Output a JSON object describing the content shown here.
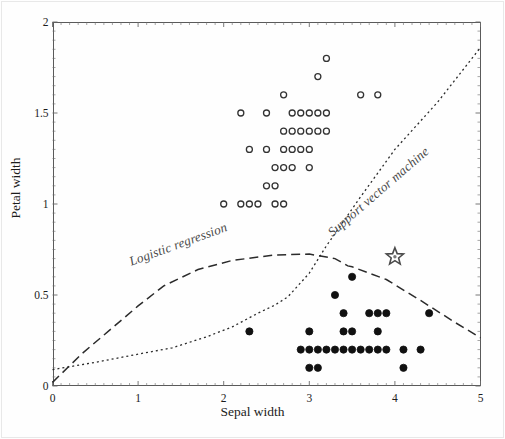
{
  "figure": {
    "background": "#ffffff",
    "frame_color": "#5a5a5a"
  },
  "chart_data": {
    "type": "scatter",
    "title": "",
    "xlabel": "Sepal width",
    "ylabel": "Petal width",
    "xlim": [
      0,
      5
    ],
    "ylim": [
      0,
      2
    ],
    "xticks": [
      0,
      1,
      2,
      3,
      4,
      5
    ],
    "xtick_labels": [
      "0",
      "1",
      "2",
      "3",
      "4",
      "5"
    ],
    "yticks": [
      0,
      0.5,
      1,
      1.5,
      2
    ],
    "ytick_labels": [
      "0",
      "0.5",
      "1",
      "1.5",
      "2"
    ],
    "grid": false,
    "legend": "none (inline rotated curve labels)",
    "series": [
      {
        "name": "class-open-circle",
        "marker": "open-circle",
        "color": "#333333",
        "points": [
          [
            3.2,
            1.8
          ],
          [
            3.1,
            1.7
          ],
          [
            2.7,
            1.6
          ],
          [
            3.6,
            1.6
          ],
          [
            3.8,
            1.6
          ],
          [
            2.2,
            1.5
          ],
          [
            2.5,
            1.5
          ],
          [
            2.8,
            1.5
          ],
          [
            2.9,
            1.5
          ],
          [
            3.0,
            1.5
          ],
          [
            3.1,
            1.5
          ],
          [
            3.2,
            1.5
          ],
          [
            2.7,
            1.4
          ],
          [
            2.8,
            1.4
          ],
          [
            2.9,
            1.4
          ],
          [
            3.0,
            1.4
          ],
          [
            3.1,
            1.4
          ],
          [
            3.2,
            1.4
          ],
          [
            2.3,
            1.3
          ],
          [
            2.5,
            1.3
          ],
          [
            2.7,
            1.3
          ],
          [
            2.8,
            1.3
          ],
          [
            2.9,
            1.3
          ],
          [
            3.0,
            1.3
          ],
          [
            2.6,
            1.2
          ],
          [
            2.7,
            1.2
          ],
          [
            2.8,
            1.2
          ],
          [
            3.0,
            1.2
          ],
          [
            2.5,
            1.1
          ],
          [
            2.6,
            1.1
          ],
          [
            2.0,
            1.0
          ],
          [
            2.2,
            1.0
          ],
          [
            2.3,
            1.0
          ],
          [
            2.4,
            1.0
          ],
          [
            2.6,
            1.0
          ],
          [
            2.7,
            1.0
          ]
        ]
      },
      {
        "name": "class-filled-circle",
        "marker": "filled-circle",
        "color": "#111111",
        "points": [
          [
            3.5,
            0.6
          ],
          [
            3.3,
            0.5
          ],
          [
            3.4,
            0.4
          ],
          [
            3.7,
            0.4
          ],
          [
            3.8,
            0.4
          ],
          [
            3.9,
            0.4
          ],
          [
            4.4,
            0.4
          ],
          [
            2.3,
            0.3
          ],
          [
            3.0,
            0.3
          ],
          [
            3.4,
            0.3
          ],
          [
            3.5,
            0.3
          ],
          [
            3.8,
            0.3
          ],
          [
            2.9,
            0.2
          ],
          [
            3.0,
            0.2
          ],
          [
            3.1,
            0.2
          ],
          [
            3.2,
            0.2
          ],
          [
            3.3,
            0.2
          ],
          [
            3.4,
            0.2
          ],
          [
            3.5,
            0.2
          ],
          [
            3.6,
            0.2
          ],
          [
            3.7,
            0.2
          ],
          [
            3.8,
            0.2
          ],
          [
            3.9,
            0.2
          ],
          [
            4.1,
            0.2
          ],
          [
            4.3,
            0.2
          ],
          [
            3.0,
            0.1
          ],
          [
            3.1,
            0.1
          ],
          [
            4.1,
            0.1
          ]
        ]
      },
      {
        "name": "query-point-star",
        "marker": "star",
        "color": "#555555",
        "points": [
          [
            4.0,
            0.71
          ]
        ]
      }
    ],
    "boundaries": [
      {
        "name": "logistic-regression",
        "label": "Logistic regression",
        "style": "dashed",
        "color": "#2b2b2b",
        "points": [
          [
            0.0,
            0.02
          ],
          [
            0.35,
            0.18
          ],
          [
            0.7,
            0.32
          ],
          [
            1.0,
            0.44
          ],
          [
            1.3,
            0.55
          ],
          [
            1.7,
            0.64
          ],
          [
            2.1,
            0.69
          ],
          [
            2.6,
            0.72
          ],
          [
            3.0,
            0.725
          ],
          [
            3.3,
            0.7
          ],
          [
            3.45,
            0.66
          ],
          [
            3.5,
            0.655
          ],
          [
            3.9,
            0.585
          ],
          [
            4.3,
            0.47
          ],
          [
            4.7,
            0.35
          ],
          [
            5.0,
            0.265
          ]
        ]
      },
      {
        "name": "support-vector-machine",
        "label": "Support vector machine",
        "style": "dotted",
        "color": "#2b2b2b",
        "points": [
          [
            0.0,
            0.09
          ],
          [
            0.5,
            0.13
          ],
          [
            1.0,
            0.175
          ],
          [
            1.4,
            0.21
          ],
          [
            1.8,
            0.27
          ],
          [
            2.1,
            0.325
          ],
          [
            2.4,
            0.4
          ],
          [
            2.6,
            0.445
          ],
          [
            2.75,
            0.49
          ],
          [
            3.0,
            0.62
          ],
          [
            3.2,
            0.77
          ],
          [
            3.6,
            1.04
          ],
          [
            4.0,
            1.3
          ],
          [
            4.5,
            1.56
          ],
          [
            5.0,
            1.86
          ]
        ]
      }
    ]
  },
  "annotations": {
    "logistic_label": "Logistic regression",
    "svm_label": "Support vector machine"
  }
}
